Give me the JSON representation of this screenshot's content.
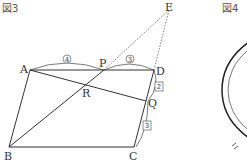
{
  "figures": {
    "fig3": {
      "title": "図3",
      "points": {
        "A": "A",
        "B": "B",
        "C": "C",
        "D": "D",
        "E": "E",
        "P": "P",
        "Q": "Q",
        "R": "R"
      },
      "ratios": {
        "AP": "4",
        "PD": "3",
        "DQ": "2",
        "QC": "3"
      }
    },
    "fig4": {
      "title": "図4"
    }
  }
}
